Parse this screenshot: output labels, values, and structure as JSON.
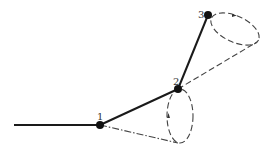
{
  "diagram": {
    "title": "",
    "nodes": [
      {
        "id": "1",
        "label": "1",
        "x": 100,
        "y": 125
      },
      {
        "id": "2",
        "label": "2",
        "x": 178,
        "y": 89
      },
      {
        "id": "3",
        "label": "3",
        "x": 208,
        "y": 15
      }
    ],
    "links": [
      {
        "from": "base",
        "to": "1",
        "style": "solid"
      },
      {
        "from": "1",
        "to": "2",
        "style": "solid"
      },
      {
        "from": "2",
        "to": "3",
        "style": "solid"
      }
    ],
    "cones": [
      {
        "apex": "1",
        "around": "2",
        "style": "dash-dot",
        "description": "rotation cone of link 1-2"
      },
      {
        "apex": "2",
        "around": "3",
        "style": "dashed",
        "description": "rotation cone of link 2-3"
      }
    ],
    "colors": {
      "line": "#1a1a1a",
      "node": "#111111",
      "label": "#333333",
      "background": "#ffffff"
    }
  }
}
